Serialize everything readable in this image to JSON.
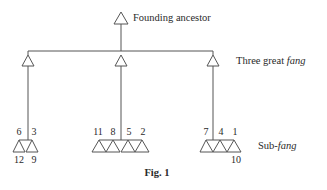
{
  "diagram": {
    "caption": "Fig. 1",
    "labels": {
      "founding": "Founding ancestor",
      "great_prefix": "Three great ",
      "great_italic": "fang",
      "sub_prefix": "Sub-",
      "sub_italic": "fang"
    },
    "sub_fang_groups": [
      {
        "top_labels": [
          "6",
          "3"
        ],
        "bottom_labels": [
          "12",
          "9"
        ]
      },
      {
        "top_labels": [
          "11",
          "8",
          "5",
          "2"
        ],
        "bottom_labels": []
      },
      {
        "top_labels": [
          "7",
          "4",
          "1"
        ],
        "bottom_labels": [
          "",
          "",
          "10"
        ]
      }
    ],
    "line_color": "#555555"
  }
}
